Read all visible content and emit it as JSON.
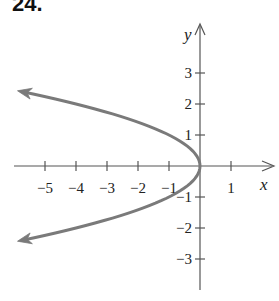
{
  "problem_number": "24.",
  "chart_data": {
    "type": "line",
    "title": "",
    "equation_depicted": "x = -y^2",
    "xlabel": "x",
    "ylabel": "y",
    "xlim": [
      -5.8,
      2.4
    ],
    "ylim": [
      -3.9,
      4.4
    ],
    "grid": false,
    "x_ticks": [
      -5,
      -4,
      -3,
      -2,
      -1,
      1
    ],
    "x_tick_labels": [
      "−5",
      "−4",
      "−3",
      "−2",
      "−1",
      "1"
    ],
    "y_ticks": [
      3,
      2,
      1,
      -1,
      -2,
      -3
    ],
    "y_tick_labels": [
      "3",
      "2",
      "1",
      "−1",
      "−2",
      "−3"
    ],
    "series": [
      {
        "name": "parabola opening left",
        "color": "#7a7a7a",
        "arrows_at_ends": true,
        "points": [
          [
            -5.76,
            2.4
          ],
          [
            -4,
            2
          ],
          [
            -2.25,
            1.5
          ],
          [
            -1,
            1
          ],
          [
            -0.25,
            0.5
          ],
          [
            0,
            0
          ],
          [
            -0.25,
            -0.5
          ],
          [
            -1,
            -1
          ],
          [
            -2.25,
            -1.5
          ],
          [
            -4,
            -2
          ],
          [
            -5.76,
            -2.4
          ]
        ]
      }
    ]
  },
  "colors": {
    "axis": "#555555",
    "curve": "#7a7a7a",
    "text": "#222222"
  }
}
